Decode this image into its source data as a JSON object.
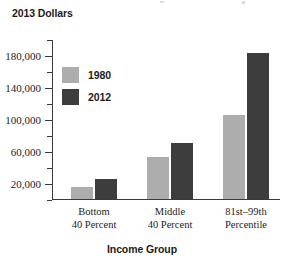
{
  "chart_data": {
    "type": "bar",
    "title": "",
    "unit_label": "2013 Dollars",
    "xlabel": "Income Group",
    "ylabel": "",
    "categories": [
      "Bottom 40 Percent",
      "Middle 40 Percent",
      "81st–99th Percentile"
    ],
    "category_lines": [
      [
        "Bottom",
        "40 Percent"
      ],
      [
        "Middle",
        "40 Percent"
      ],
      [
        "81st–99th",
        "Percentile"
      ]
    ],
    "series": [
      {
        "name": "1980",
        "color": "#adadad",
        "values": [
          15000,
          52000,
          105000
        ]
      },
      {
        "name": "2012",
        "color": "#3d3d3d",
        "values": [
          24000,
          70000,
          182000
        ]
      }
    ],
    "ylim": [
      0,
      200000
    ],
    "ytick_values": [
      20000,
      60000,
      100000,
      140000,
      180000
    ],
    "ytick_labels": [
      "20,000",
      "60,000",
      "100,000",
      "140,000",
      "180,000"
    ],
    "yminor_tick_values": [
      0,
      40000,
      80000,
      120000,
      160000,
      200000
    ],
    "grid": false,
    "legend_position": "upper-left-inside"
  },
  "legend": {
    "items": [
      {
        "label": "1980",
        "color": "#adadad"
      },
      {
        "label": "2012",
        "color": "#3d3d3d"
      }
    ]
  }
}
